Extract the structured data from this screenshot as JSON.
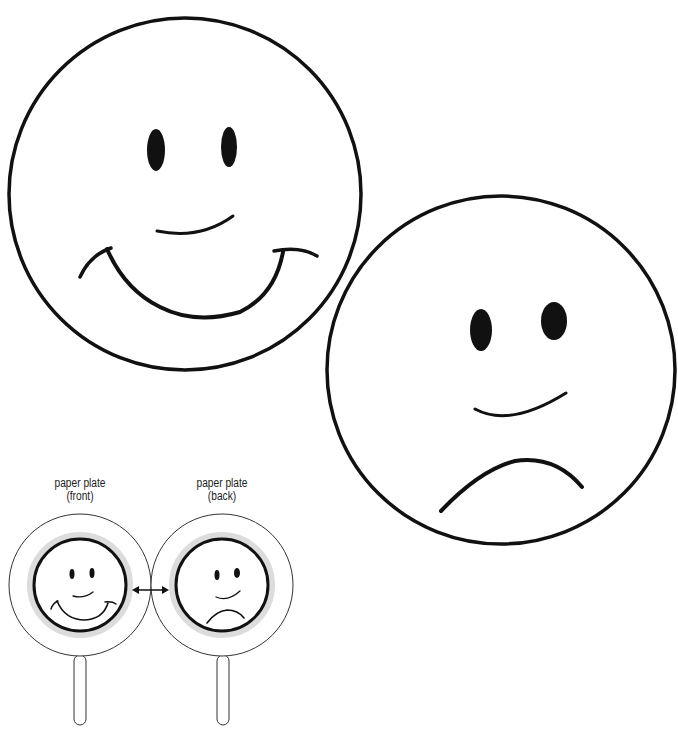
{
  "faces": {
    "happy": {
      "expression": "happy",
      "label": "happy face"
    },
    "sad": {
      "expression": "sad",
      "label": "sad face"
    }
  },
  "diagram": {
    "front_label_line1": "paper plate",
    "front_label_line2": "(front)",
    "back_label_line1": "paper plate",
    "back_label_line2": "(back)",
    "arrow": "double-headed arrow"
  },
  "colors": {
    "ink": "#111111",
    "halo": "#d8d8d8",
    "background": "#ffffff"
  }
}
